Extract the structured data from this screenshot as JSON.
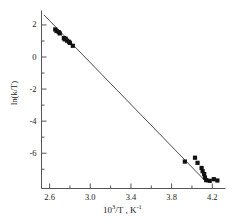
{
  "chart_data": {
    "type": "scatter",
    "title": "",
    "xlabel": "10³/T , K⁻¹",
    "ylabel": "ln(k/T)",
    "xlabel_parts": {
      "base": "10",
      "exp": "3",
      "rest": "/T , K",
      "rest_exp": "-1"
    },
    "xlim": [
      2.52,
      4.33
    ],
    "ylim": [
      -8.2,
      2.9
    ],
    "xticks": [
      2.6,
      3.0,
      3.4,
      3.8,
      4.2
    ],
    "xtick_labels": [
      "2.6",
      "3.0",
      "3.4",
      "3.8",
      "4.2"
    ],
    "xminorticks": [
      2.8,
      3.2,
      3.6,
      4.0
    ],
    "yticks": [
      2,
      0,
      -2,
      -4,
      -6
    ],
    "ytick_labels": [
      "2",
      "0",
      "-2",
      "-4",
      "-6"
    ],
    "yminorticks": [
      1,
      -1,
      -3,
      -5,
      -7
    ],
    "grid": false,
    "legend": false,
    "marker": "square",
    "marker_color": "#111111",
    "line_color": "#4d4d4d",
    "axis_color": "#555555",
    "points": [
      {
        "x": 2.655,
        "y": 1.72
      },
      {
        "x": 2.668,
        "y": 1.62
      },
      {
        "x": 2.69,
        "y": 1.55
      },
      {
        "x": 2.7,
        "y": 1.47
      },
      {
        "x": 2.74,
        "y": 1.18
      },
      {
        "x": 2.748,
        "y": 1.1
      },
      {
        "x": 2.757,
        "y": 1.15
      },
      {
        "x": 2.772,
        "y": 1.02
      },
      {
        "x": 2.79,
        "y": 0.95
      },
      {
        "x": 2.8,
        "y": 0.88
      },
      {
        "x": 2.828,
        "y": 0.7
      },
      {
        "x": 3.93,
        "y": -6.52
      },
      {
        "x": 4.03,
        "y": -6.28
      },
      {
        "x": 4.055,
        "y": -6.6
      },
      {
        "x": 4.095,
        "y": -6.92
      },
      {
        "x": 4.105,
        "y": -7.12
      },
      {
        "x": 4.12,
        "y": -7.3
      },
      {
        "x": 4.128,
        "y": -7.52
      },
      {
        "x": 4.14,
        "y": -7.68
      },
      {
        "x": 4.175,
        "y": -7.72
      },
      {
        "x": 4.215,
        "y": -7.62
      },
      {
        "x": 4.25,
        "y": -7.7
      }
    ],
    "fit_line": {
      "x0": 2.545,
      "y0": 2.62,
      "x1": 4.145,
      "y1": -7.82
    }
  }
}
